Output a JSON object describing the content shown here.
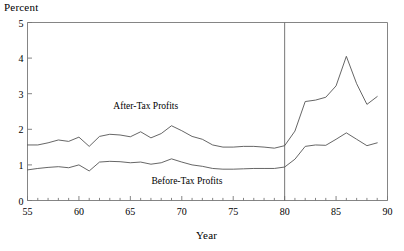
{
  "chart_data": {
    "type": "line",
    "title": "",
    "ylabel": "Percent",
    "xlabel": "Year",
    "xlim": [
      55,
      90
    ],
    "ylim": [
      0,
      5
    ],
    "grid": false,
    "legend_position": "inline-annotation",
    "y_ticks": [
      "0",
      "1",
      "2",
      "3",
      "4",
      "5"
    ],
    "y_tick_values": [
      0,
      1,
      2,
      3,
      4,
      5
    ],
    "x_ticks": [
      "55",
      "60",
      "65",
      "70",
      "75",
      "80",
      "85",
      "90"
    ],
    "x_tick_values": [
      55,
      60,
      65,
      70,
      75,
      80,
      85,
      90
    ],
    "x_minor_tick_step": 1,
    "annotations": [
      {
        "name": "after-tax-label",
        "text": "After-Tax Profits",
        "x": 66.5,
        "y": 2.62
      },
      {
        "name": "before-tax-label",
        "text": "Before-Tax Profits",
        "x": 70.5,
        "y": 0.52
      }
    ],
    "reference_lines": [
      {
        "name": "year-1980-divider",
        "orientation": "vertical",
        "x": 80
      }
    ],
    "x": [
      55,
      56,
      57,
      58,
      59,
      60,
      61,
      62,
      63,
      64,
      65,
      66,
      67,
      68,
      69,
      70,
      71,
      72,
      73,
      74,
      75,
      76,
      77,
      78,
      79,
      80,
      81,
      82,
      83,
      84,
      85,
      86,
      87,
      88,
      89
    ],
    "series": [
      {
        "name": "After-Tax Profits",
        "color": "#555555",
        "values": [
          1.56,
          1.56,
          1.6,
          1.66,
          1.73,
          1.78,
          1.72,
          1.82,
          1.83,
          1.8,
          1.58,
          1.83,
          1.92,
          2.0,
          2.12,
          2.05,
          1.95,
          1.86,
          1.77,
          1.68,
          1.63,
          1.78,
          1.97,
          2.08,
          2.11,
          1.66,
          1.42,
          1.38,
          1.33,
          1.34,
          1.42,
          1.47,
          1.51,
          1.56,
          1.58
        ],
        "values_note": "traced from pixel path"
      },
      {
        "name": "Before-Tax Profits",
        "color": "#555555",
        "values": [
          0.86,
          0.88,
          0.91,
          0.93,
          0.96,
          0.99,
          0.85,
          1.09,
          1.1,
          1.09,
          1.05,
          1.06,
          1.05,
          1.03,
          1.15,
          1.1,
          1.02,
          0.97,
          0.95,
          0.93,
          0.93,
          0.95,
          1.0,
          1.05,
          1.1,
          1.0,
          0.95,
          1.02,
          1.05,
          1.06,
          1.1,
          1.12,
          1.1,
          1.08,
          1.06
        ]
      }
    ]
  },
  "traced_paths": {
    "after_tax": [
      [
        55,
        1.56
      ],
      [
        56,
        1.56
      ],
      [
        57,
        1.62
      ],
      [
        58,
        1.7
      ],
      [
        59,
        1.66
      ],
      [
        60,
        1.78
      ],
      [
        61,
        1.52
      ],
      [
        62,
        1.8
      ],
      [
        63,
        1.86
      ],
      [
        64,
        1.84
      ],
      [
        65,
        1.79
      ],
      [
        66,
        1.93
      ],
      [
        67,
        1.76
      ],
      [
        68,
        1.88
      ],
      [
        69,
        2.1
      ],
      [
        70,
        1.96
      ],
      [
        71,
        1.8
      ],
      [
        72,
        1.72
      ],
      [
        73,
        1.56
      ],
      [
        74,
        1.5
      ],
      [
        75,
        1.5
      ],
      [
        76,
        1.52
      ],
      [
        77,
        1.52
      ],
      [
        78,
        1.5
      ],
      [
        79,
        1.47
      ],
      [
        80,
        1.54
      ],
      [
        81,
        1.95
      ],
      [
        82,
        2.78
      ],
      [
        83,
        2.82
      ],
      [
        84,
        2.9
      ],
      [
        85,
        3.22
      ],
      [
        86,
        4.05
      ],
      [
        87,
        3.28
      ],
      [
        88,
        2.7
      ],
      [
        89,
        2.92
      ]
    ],
    "before_tax": [
      [
        55,
        0.86
      ],
      [
        56,
        0.9
      ],
      [
        57,
        0.93
      ],
      [
        58,
        0.95
      ],
      [
        59,
        0.92
      ],
      [
        60,
        1.0
      ],
      [
        61,
        0.83
      ],
      [
        62,
        1.08
      ],
      [
        63,
        1.1
      ],
      [
        64,
        1.09
      ],
      [
        65,
        1.06
      ],
      [
        66,
        1.08
      ],
      [
        67,
        1.02
      ],
      [
        68,
        1.06
      ],
      [
        69,
        1.17
      ],
      [
        70,
        1.08
      ],
      [
        71,
        1.0
      ],
      [
        72,
        0.96
      ],
      [
        73,
        0.9
      ],
      [
        74,
        0.88
      ],
      [
        75,
        0.88
      ],
      [
        76,
        0.89
      ],
      [
        77,
        0.9
      ],
      [
        78,
        0.9
      ],
      [
        79,
        0.9
      ],
      [
        80,
        0.94
      ],
      [
        81,
        1.16
      ],
      [
        82,
        1.52
      ],
      [
        83,
        1.56
      ],
      [
        84,
        1.55
      ],
      [
        85,
        1.72
      ],
      [
        86,
        1.9
      ],
      [
        87,
        1.72
      ],
      [
        88,
        1.54
      ],
      [
        89,
        1.62
      ]
    ]
  },
  "style": {
    "line_color": "#555555",
    "frame_color": "#777777",
    "text_color": "#000000",
    "background": "#ffffff"
  }
}
